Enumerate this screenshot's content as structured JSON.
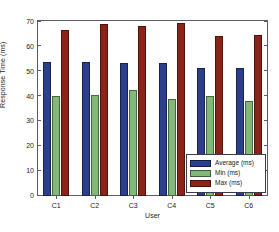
{
  "chart_data": {
    "type": "bar",
    "title": "",
    "xlabel": "User",
    "ylabel": "Response Time (ms)",
    "categories": [
      "C1",
      "C2",
      "C3",
      "C4",
      "C5",
      "C6"
    ],
    "series": [
      {
        "name": "Average (ms)",
        "color": "#2b3f8c",
        "values": [
          53.3,
          53.3,
          53.1,
          53.1,
          51.0,
          50.8
        ]
      },
      {
        "name": "Min (ms)",
        "color": "#82b878",
        "values": [
          39.6,
          40.3,
          42.2,
          38.4,
          39.7,
          37.6
        ]
      },
      {
        "name": "Max (ms)",
        "color": "#8c2318",
        "values": [
          66.2,
          68.4,
          67.5,
          69.0,
          63.6,
          63.9
        ]
      }
    ],
    "ylim": [
      0,
      70
    ],
    "yticks": [
      0,
      10,
      20,
      30,
      40,
      50,
      60,
      70
    ],
    "ytick_labels": [
      "0",
      "10",
      "20",
      "30",
      "40",
      "50",
      "60",
      "70"
    ],
    "grid": false,
    "legend_position": "lower-right"
  },
  "legend": {
    "entries": [
      {
        "label": "Average (ms)"
      },
      {
        "label": "Min (ms)"
      },
      {
        "label": "Max (ms)"
      }
    ]
  }
}
